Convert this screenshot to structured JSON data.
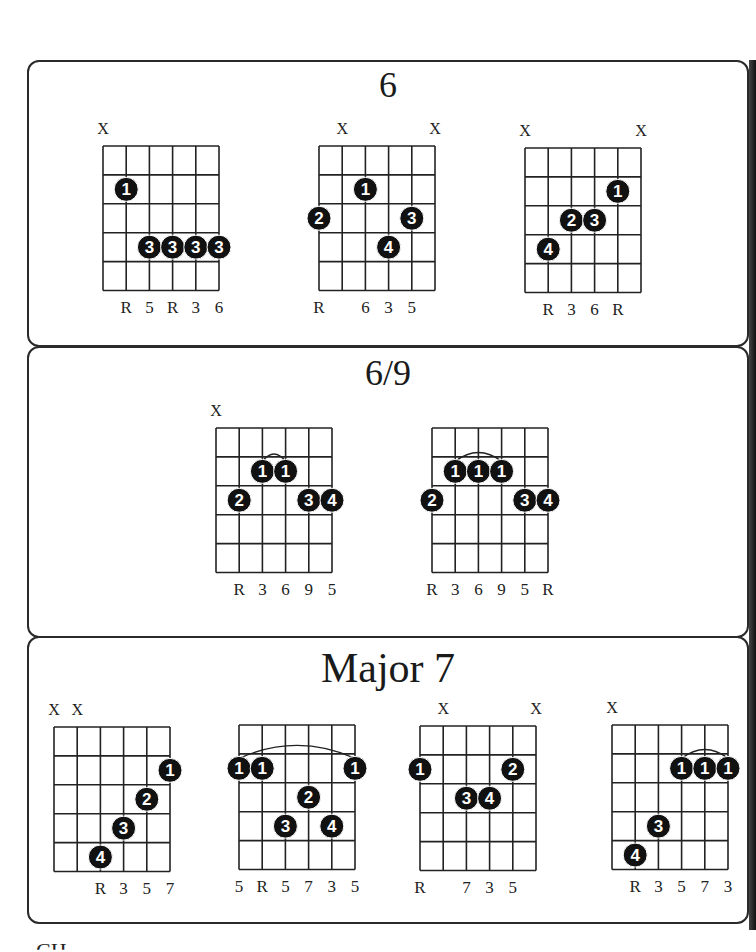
{
  "sections": [
    {
      "title": "6",
      "chords": [
        {
          "muted": [
            1
          ],
          "barres": [],
          "dots": [
            {
              "string": 2,
              "fret": 2,
              "finger": "1"
            },
            {
              "string": 3,
              "fret": 4,
              "finger": "3"
            },
            {
              "string": 4,
              "fret": 4,
              "finger": "3"
            },
            {
              "string": 5,
              "fret": 4,
              "finger": "3"
            },
            {
              "string": 6,
              "fret": 4,
              "finger": "3"
            }
          ],
          "intervals": [
            {
              "string": 2,
              "label": "R"
            },
            {
              "string": 3,
              "label": "5"
            },
            {
              "string": 4,
              "label": "R"
            },
            {
              "string": 5,
              "label": "3"
            },
            {
              "string": 6,
              "label": "6"
            }
          ]
        },
        {
          "muted": [
            2,
            6
          ],
          "barres": [],
          "dots": [
            {
              "string": 3,
              "fret": 2,
              "finger": "1"
            },
            {
              "string": 1,
              "fret": 3,
              "finger": "2"
            },
            {
              "string": 5,
              "fret": 3,
              "finger": "3"
            },
            {
              "string": 4,
              "fret": 4,
              "finger": "4"
            }
          ],
          "intervals": [
            {
              "string": 1,
              "label": "R"
            },
            {
              "string": 3,
              "label": "6"
            },
            {
              "string": 4,
              "label": "3"
            },
            {
              "string": 5,
              "label": "5"
            }
          ]
        },
        {
          "muted": [
            1,
            6
          ],
          "barres": [],
          "dots": [
            {
              "string": 5,
              "fret": 2,
              "finger": "1"
            },
            {
              "string": 3,
              "fret": 3,
              "finger": "2"
            },
            {
              "string": 4,
              "fret": 3,
              "finger": "3"
            },
            {
              "string": 2,
              "fret": 4,
              "finger": "4"
            }
          ],
          "intervals": [
            {
              "string": 2,
              "label": "R"
            },
            {
              "string": 3,
              "label": "3"
            },
            {
              "string": 4,
              "label": "6"
            },
            {
              "string": 5,
              "label": "R"
            }
          ]
        }
      ]
    },
    {
      "title": "6/9",
      "chords": [
        {
          "muted": [
            1
          ],
          "barres": [
            {
              "from": 3,
              "to": 4,
              "fret": 2
            }
          ],
          "dots": [
            {
              "string": 3,
              "fret": 2,
              "finger": "1"
            },
            {
              "string": 4,
              "fret": 2,
              "finger": "1"
            },
            {
              "string": 2,
              "fret": 3,
              "finger": "2"
            },
            {
              "string": 5,
              "fret": 3,
              "finger": "3"
            },
            {
              "string": 6,
              "fret": 3,
              "finger": "4"
            }
          ],
          "intervals": [
            {
              "string": 2,
              "label": "R"
            },
            {
              "string": 3,
              "label": "3"
            },
            {
              "string": 4,
              "label": "6"
            },
            {
              "string": 5,
              "label": "9"
            },
            {
              "string": 6,
              "label": "5"
            }
          ]
        },
        {
          "muted": [],
          "barres": [
            {
              "from": 2,
              "to": 4,
              "fret": 2
            }
          ],
          "dots": [
            {
              "string": 2,
              "fret": 2,
              "finger": "1"
            },
            {
              "string": 3,
              "fret": 2,
              "finger": "1"
            },
            {
              "string": 4,
              "fret": 2,
              "finger": "1"
            },
            {
              "string": 1,
              "fret": 3,
              "finger": "2"
            },
            {
              "string": 5,
              "fret": 3,
              "finger": "3"
            },
            {
              "string": 6,
              "fret": 3,
              "finger": "4"
            }
          ],
          "intervals": [
            {
              "string": 1,
              "label": "R"
            },
            {
              "string": 2,
              "label": "3"
            },
            {
              "string": 3,
              "label": "6"
            },
            {
              "string": 4,
              "label": "9"
            },
            {
              "string": 5,
              "label": "5"
            },
            {
              "string": 6,
              "label": "R"
            }
          ]
        }
      ]
    },
    {
      "title": "Major 7",
      "chords": [
        {
          "muted": [
            1,
            2
          ],
          "barres": [],
          "dots": [
            {
              "string": 6,
              "fret": 2,
              "finger": "1"
            },
            {
              "string": 5,
              "fret": 3,
              "finger": "2"
            },
            {
              "string": 4,
              "fret": 4,
              "finger": "3"
            },
            {
              "string": 3,
              "fret": 5,
              "finger": "4"
            }
          ],
          "intervals": [
            {
              "string": 3,
              "label": "R"
            },
            {
              "string": 4,
              "label": "3"
            },
            {
              "string": 5,
              "label": "5"
            },
            {
              "string": 6,
              "label": "7"
            }
          ]
        },
        {
          "muted": [],
          "barres": [
            {
              "from": 1,
              "to": 6,
              "fret": 2
            }
          ],
          "dots": [
            {
              "string": 1,
              "fret": 2,
              "finger": "1"
            },
            {
              "string": 2,
              "fret": 2,
              "finger": "1"
            },
            {
              "string": 6,
              "fret": 2,
              "finger": "1"
            },
            {
              "string": 4,
              "fret": 3,
              "finger": "2"
            },
            {
              "string": 3,
              "fret": 4,
              "finger": "3"
            },
            {
              "string": 5,
              "fret": 4,
              "finger": "4"
            }
          ],
          "intervals": [
            {
              "string": 1,
              "label": "5"
            },
            {
              "string": 2,
              "label": "R"
            },
            {
              "string": 3,
              "label": "5"
            },
            {
              "string": 4,
              "label": "7"
            },
            {
              "string": 5,
              "label": "3"
            },
            {
              "string": 6,
              "label": "5"
            }
          ]
        },
        {
          "muted": [
            2,
            6
          ],
          "barres": [],
          "dots": [
            {
              "string": 1,
              "fret": 2,
              "finger": "1"
            },
            {
              "string": 5,
              "fret": 2,
              "finger": "2"
            },
            {
              "string": 3,
              "fret": 3,
              "finger": "3"
            },
            {
              "string": 4,
              "fret": 3,
              "finger": "4"
            }
          ],
          "intervals": [
            {
              "string": 1,
              "label": "R"
            },
            {
              "string": 3,
              "label": "7"
            },
            {
              "string": 4,
              "label": "3"
            },
            {
              "string": 5,
              "label": "5"
            }
          ]
        },
        {
          "muted": [
            1
          ],
          "barres": [
            {
              "from": 4,
              "to": 6,
              "fret": 2
            }
          ],
          "dots": [
            {
              "string": 4,
              "fret": 2,
              "finger": "1"
            },
            {
              "string": 5,
              "fret": 2,
              "finger": "1"
            },
            {
              "string": 6,
              "fret": 2,
              "finger": "1"
            },
            {
              "string": 3,
              "fret": 4,
              "finger": "3"
            },
            {
              "string": 2,
              "fret": 5,
              "finger": "4"
            }
          ],
          "intervals": [
            {
              "string": 2,
              "label": "R"
            },
            {
              "string": 3,
              "label": "3"
            },
            {
              "string": 4,
              "label": "5"
            },
            {
              "string": 5,
              "label": "7"
            },
            {
              "string": 6,
              "label": "3"
            }
          ]
        }
      ]
    }
  ],
  "muted_marker": "X",
  "footer_partial": "CH"
}
